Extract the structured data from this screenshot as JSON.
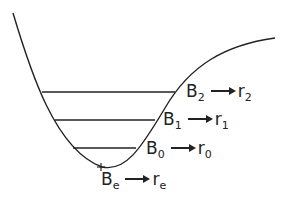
{
  "diagram": {
    "type": "potential-energy-curve",
    "stroke_color": "#222222",
    "levels": [
      {
        "id": "B2",
        "sym": "B",
        "sub": "2",
        "rsym": "r",
        "rsub": "2",
        "y": 92,
        "x1": 42,
        "x2": 175
      },
      {
        "id": "B1",
        "sym": "B",
        "sub": "1",
        "rsym": "r",
        "rsub": "1",
        "y": 120,
        "x1": 55,
        "x2": 155
      },
      {
        "id": "B0",
        "sym": "B",
        "sub": "0",
        "rsym": "r",
        "rsub": "0",
        "y": 148,
        "x1": 73,
        "x2": 136
      }
    ],
    "equilibrium": {
      "sym": "B",
      "sub": "e",
      "rsym": "r",
      "rsub": "e",
      "x": 102,
      "y": 167
    }
  }
}
